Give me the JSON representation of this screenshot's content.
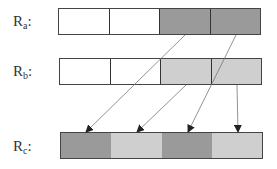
{
  "diagram": {
    "rows": [
      {
        "id": "ra",
        "label_main": "R",
        "label_sub": "a",
        "label_suffix": ":",
        "cells": [
          {
            "fill": "#ffffff"
          },
          {
            "fill": "#ffffff"
          },
          {
            "fill": "#9a9a9a"
          },
          {
            "fill": "#9a9a9a"
          }
        ]
      },
      {
        "id": "rb",
        "label_main": "R",
        "label_sub": "b",
        "label_suffix": ":",
        "cells": [
          {
            "fill": "#ffffff"
          },
          {
            "fill": "#ffffff"
          },
          {
            "fill": "#cfcfcf"
          },
          {
            "fill": "#cfcfcf"
          }
        ]
      },
      {
        "id": "rc",
        "label_main": "R",
        "label_sub": "c",
        "label_suffix": ":",
        "cells": [
          {
            "fill": "#9a9a9a"
          },
          {
            "fill": "#cfcfcf"
          },
          {
            "fill": "#9a9a9a"
          },
          {
            "fill": "#cfcfcf"
          }
        ]
      }
    ],
    "arrows": [
      {
        "from": "ra.cell3",
        "to": "rc.cell1"
      },
      {
        "from": "ra.cell4",
        "to": "rc.cell3"
      },
      {
        "from": "rb.cell3",
        "to": "rc.cell2"
      },
      {
        "from": "rb.cell4",
        "to": "rc.cell4"
      }
    ]
  }
}
